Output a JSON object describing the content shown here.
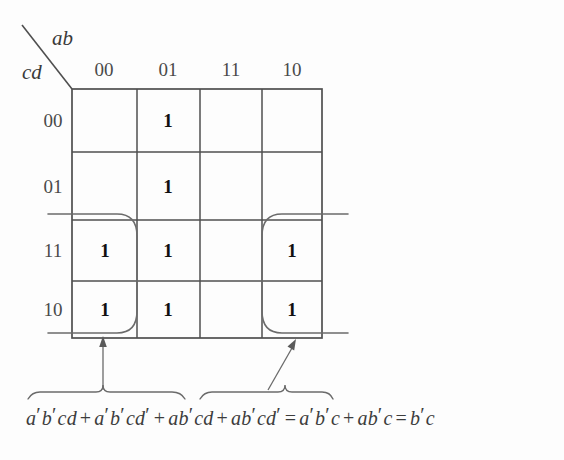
{
  "figure": {
    "axis_labels": {
      "columns": "ab",
      "rows": "cd"
    },
    "column_headers": [
      "00",
      "01",
      "11",
      "10"
    ],
    "row_headers": [
      "00",
      "01",
      "11",
      "10"
    ],
    "cells": [
      [
        "",
        "1",
        "",
        ""
      ],
      [
        "",
        "1",
        "",
        ""
      ],
      [
        "1",
        "1",
        "",
        "1"
      ],
      [
        "1",
        "1",
        "",
        "1"
      ]
    ],
    "groups": [
      {
        "name": "left-wrap-group",
        "columns": [
          "00"
        ],
        "rows": [
          "11",
          "10"
        ]
      },
      {
        "name": "right-wrap-group",
        "columns": [
          "10"
        ],
        "rows": [
          "11",
          "10"
        ]
      }
    ],
    "annotations": {
      "left_arrow": "points to left group",
      "right_arrow": "points to right group",
      "left_brace_term": "a'b'cd + a'b'cd'",
      "right_brace_term": "ab'cd + ab'cd'"
    },
    "equation": {
      "terms": [
        {
          "vars": "a",
          "prime": true
        },
        {
          "vars": "b",
          "prime": true
        },
        {
          "vars": "cd",
          "prime": false
        }
      ],
      "text_parts": [
        "a",
        "'",
        "b",
        "'",
        "cd",
        " + ",
        "a",
        "'",
        "b",
        "'",
        "cd",
        "'",
        " + ",
        "ab",
        "'",
        "cd",
        " + ",
        "ab",
        "'",
        "cd",
        "'",
        " = ",
        "a",
        "'",
        "b",
        "'",
        "c",
        " + ",
        "ab",
        "'",
        "c",
        " = ",
        "b",
        "'",
        "c"
      ],
      "full": "a'b'cd + a'b'cd' + ab'cd + ab'cd' = a'b'c + ab'c = b'c",
      "seg1": "a",
      "seg2": "b",
      "seg3": "cd",
      "seg4": "a",
      "seg5": "b",
      "seg6": "cd",
      "seg7": "ab",
      "seg8": "cd",
      "seg9": "ab",
      "seg10": "cd",
      "seg11": "a",
      "seg12": "b",
      "seg13": "c",
      "seg14": "ab",
      "seg15": "c",
      "seg16": "b",
      "seg17": "c",
      "plus": "+",
      "equals": "=",
      "prime": "′"
    },
    "colors": {
      "background": "#fdfdfd",
      "grid_line": "#4f4f4f",
      "loop_line": "#6b6b6b",
      "text": "#3c3c3c",
      "one_text": "#101010"
    }
  }
}
